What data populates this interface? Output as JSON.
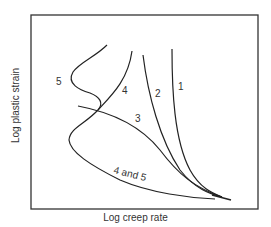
{
  "figure": {
    "xlabel": "Log creep rate",
    "ylabel": "Log plastic strain",
    "frame": {
      "x": 31,
      "y": 15,
      "width": 227,
      "height": 194
    },
    "curves": [
      {
        "id": "1",
        "label": "1"
      },
      {
        "id": "2",
        "label": "2"
      },
      {
        "id": "3",
        "label": "3"
      },
      {
        "id": "4",
        "label": "4"
      },
      {
        "id": "5",
        "label": "5"
      },
      {
        "id": "4-and-5",
        "label": "4 and 5"
      }
    ],
    "line_color": "#222222"
  }
}
